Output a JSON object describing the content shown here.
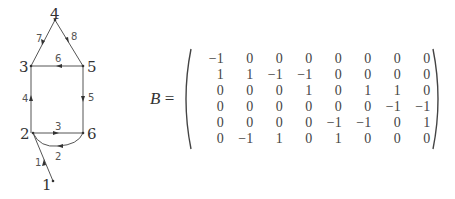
{
  "graph": {
    "vertices": [
      {
        "id": "1",
        "label": "1",
        "x": 53,
        "y": 181
      },
      {
        "id": "2",
        "label": "2",
        "x": 33,
        "y": 133
      },
      {
        "id": "3",
        "label": "3",
        "x": 31,
        "y": 66
      },
      {
        "id": "4",
        "label": "4",
        "x": 55,
        "y": 20
      },
      {
        "id": "5",
        "label": "5",
        "x": 83,
        "y": 66
      },
      {
        "id": "6",
        "label": "6",
        "x": 83,
        "y": 133
      }
    ],
    "edges": [
      {
        "id": "1",
        "label": "1",
        "from": "1",
        "to": "2"
      },
      {
        "id": "2",
        "label": "2",
        "from": "6",
        "to": "2",
        "curved": true
      },
      {
        "id": "3",
        "label": "3",
        "from": "2",
        "to": "6"
      },
      {
        "id": "4",
        "label": "4",
        "from": "2",
        "to": "3"
      },
      {
        "id": "5",
        "label": "5",
        "from": "5",
        "to": "6"
      },
      {
        "id": "6",
        "label": "6",
        "from": "5",
        "to": "3"
      },
      {
        "id": "7",
        "label": "7",
        "from": "4",
        "to": "3"
      },
      {
        "id": "8",
        "label": "8",
        "from": "4",
        "to": "5"
      }
    ]
  },
  "matrix": {
    "name": "B",
    "equals": "=",
    "rows": [
      [
        "−1",
        "0",
        "0",
        "0",
        "0",
        "0",
        "0",
        "0"
      ],
      [
        "1",
        "1",
        "−1",
        "−1",
        "0",
        "0",
        "0",
        "0"
      ],
      [
        "0",
        "0",
        "0",
        "1",
        "0",
        "1",
        "1",
        "0"
      ],
      [
        "0",
        "0",
        "0",
        "0",
        "0",
        "0",
        "−1",
        "−1"
      ],
      [
        "0",
        "0",
        "0",
        "0",
        "−1",
        "−1",
        "0",
        "1"
      ],
      [
        "0",
        "−1",
        "1",
        "0",
        "1",
        "0",
        "0",
        "0"
      ]
    ]
  }
}
